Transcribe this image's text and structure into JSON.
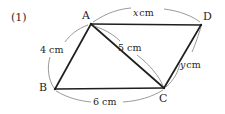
{
  "figure": {
    "item_number": "(1)",
    "vertices": [
      {
        "name": "A",
        "label": "A",
        "x": 91,
        "y": 24,
        "label_x": 82,
        "label_y": 10
      },
      {
        "name": "B",
        "label": "B",
        "x": 55,
        "y": 89,
        "label_x": 39,
        "label_y": 82
      },
      {
        "name": "C",
        "label": "C",
        "x": 164,
        "y": 88,
        "label_x": 159,
        "label_y": 93
      },
      {
        "name": "D",
        "label": "D",
        "x": 201,
        "y": 25,
        "label_x": 203,
        "label_y": 11
      }
    ],
    "edges": [
      {
        "name": "side-ab",
        "from": "A",
        "to": "B"
      },
      {
        "name": "side-bc",
        "from": "B",
        "to": "C"
      },
      {
        "name": "side-cd",
        "from": "C",
        "to": "D"
      },
      {
        "name": "side-ad",
        "from": "A",
        "to": "D"
      },
      {
        "name": "diagonal-ac",
        "from": "A",
        "to": "C"
      }
    ],
    "measures": [
      {
        "name": "length-ad",
        "text": "x cm",
        "value": "x",
        "unit": "cm",
        "label_x": 133,
        "label_y": 8,
        "edge": "A-D"
      },
      {
        "name": "length-ab",
        "text": "4 cm",
        "value": "4",
        "unit": "cm",
        "label_x": 40,
        "label_y": 45,
        "edge": "A-B"
      },
      {
        "name": "length-ac",
        "text": "5 cm",
        "value": "5",
        "unit": "cm",
        "label_x": 118,
        "label_y": 43,
        "edge": "A-C"
      },
      {
        "name": "length-cd",
        "text": "y cm",
        "value": "y",
        "unit": "cm",
        "label_x": 180,
        "label_y": 60,
        "edge": "C-D"
      },
      {
        "name": "length-bc",
        "text": "6 cm",
        "value": "6",
        "unit": "cm",
        "label_x": 93,
        "label_y": 97,
        "edge": "B-C"
      }
    ],
    "colors": {
      "ink": "#262626",
      "line": "#1f1f1f",
      "arc": "#6e6e6e",
      "background": "#ffffff"
    }
  }
}
